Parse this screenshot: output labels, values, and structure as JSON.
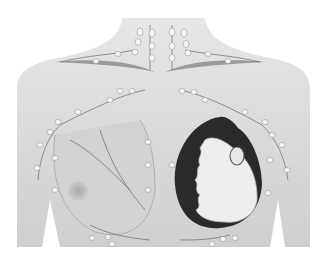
{
  "figure": {
    "alt": "Illustration of female chest showing lymph nodes and vessels; right-side breast shown in cross-section revealing glandular tissue",
    "colors": {
      "background": "#ffffff",
      "skin": "#dcdcdc",
      "skin_shadow": "#b8b8b8",
      "node": "#f4f4f4",
      "vessel": "#6a6a6a",
      "dark_tissue": "#2a2a2a",
      "gland": "#eeeeee"
    }
  }
}
